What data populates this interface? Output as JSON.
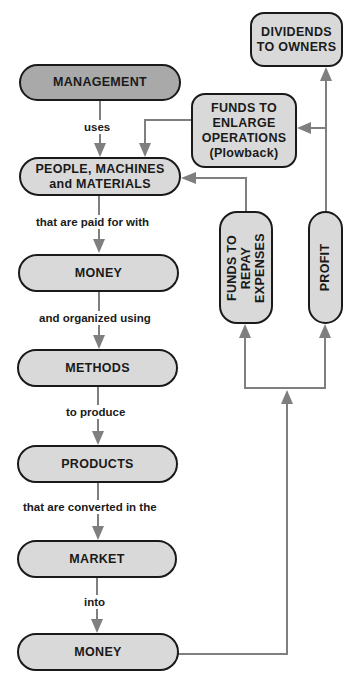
{
  "diagram": {
    "colors": {
      "box_fill": "#d9d9d9",
      "management_fill": "#a9a9a9",
      "border": "#1a1a1a",
      "connector": "#7f7f7f"
    },
    "nodes": {
      "management": {
        "label": "MANAGEMENT"
      },
      "people": {
        "line1": "PEOPLE, MACHINES",
        "line2": "and MATERIALS"
      },
      "money1": {
        "label": "MONEY"
      },
      "methods": {
        "label": "METHODS"
      },
      "products": {
        "label": "PRODUCTS"
      },
      "market": {
        "label": "MARKET"
      },
      "money2": {
        "label": "MONEY"
      },
      "funds_repay": {
        "line1": "FUNDS TO",
        "line2": "REPAY",
        "line3": "EXPENSES"
      },
      "profit": {
        "label": "PROFIT"
      },
      "funds_enlarge": {
        "line1": "FUNDS TO",
        "line2": "ENLARGE",
        "line3": "OPERATIONS",
        "line4": "(Plowback)"
      },
      "dividends": {
        "line1": "DIVIDENDS",
        "line2": "TO OWNERS"
      }
    },
    "edge_labels": {
      "uses": "uses",
      "paid_for": "that are paid for with",
      "organized": "and organized using",
      "produce": "to produce",
      "converted": "that are converted in the",
      "into": "into"
    }
  }
}
